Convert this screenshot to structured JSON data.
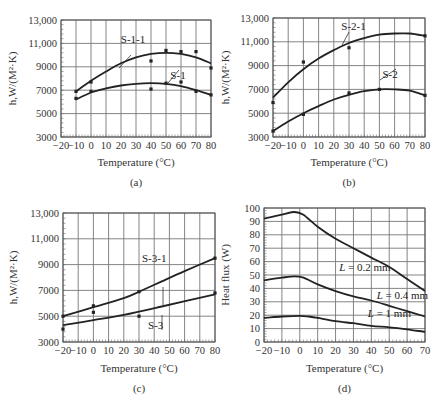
{
  "chart_data": [
    {
      "id": "a",
      "type": "line",
      "caption": "(a)",
      "xlabel": "Temperature (°C)",
      "ylabel": "h,W/(M²·K)",
      "xlim": [
        -20,
        80
      ],
      "ylim": [
        3000,
        13000
      ],
      "xticks": [
        -20,
        -10,
        0,
        10,
        20,
        30,
        40,
        50,
        60,
        70,
        80
      ],
      "yticks": [
        3000,
        5000,
        7000,
        9000,
        11000,
        13000
      ],
      "ytick_labels": [
        "3000",
        "5000",
        "7000",
        "9000",
        "11,000",
        "13,000"
      ],
      "grid": true,
      "series": [
        {
          "name": "S-1-1",
          "curve": {
            "x": [
              -10,
              0,
              10,
              20,
              30,
              40,
              50,
              60,
              70,
              80
            ],
            "y": [
              6900,
              7800,
              8600,
              9300,
              9800,
              10100,
              10200,
              10100,
              9800,
              9300
            ]
          },
          "points": {
            "x": [
              -10,
              0,
              40,
              50,
              60,
              70,
              80
            ],
            "y": [
              6900,
              7700,
              9500,
              10400,
              10300,
              10300,
              8900
            ]
          }
        },
        {
          "name": "S-1",
          "curve": {
            "x": [
              -10,
              0,
              10,
              20,
              30,
              40,
              50,
              60,
              70,
              80
            ],
            "y": [
              6200,
              6800,
              7150,
              7400,
              7550,
              7600,
              7550,
              7350,
              7000,
              6600
            ]
          },
          "points": {
            "x": [
              -10,
              0,
              40,
              50,
              60,
              70,
              80
            ],
            "y": [
              6300,
              6900,
              7100,
              7600,
              7700,
              6900,
              6600
            ]
          }
        }
      ],
      "annotations": [
        {
          "text": "S-1-1",
          "x": 28,
          "y": 11000
        },
        {
          "text": "S-1",
          "x": 58,
          "y": 8000
        }
      ]
    },
    {
      "id": "b",
      "type": "line",
      "caption": "(b)",
      "xlabel": "Temperature (°C)",
      "ylabel": "h,W/(M²·K)",
      "xlim": [
        -20,
        80
      ],
      "ylim": [
        3000,
        13000
      ],
      "xticks": [
        -20,
        -10,
        0,
        10,
        20,
        30,
        40,
        50,
        60,
        70,
        80
      ],
      "yticks": [
        3000,
        5000,
        7000,
        9000,
        11000,
        13000
      ],
      "ytick_labels": [
        "3000",
        "5000",
        "7000",
        "9000",
        "11,000",
        "13,000"
      ],
      "grid": true,
      "series": [
        {
          "name": "S-2-1",
          "curve": {
            "x": [
              -20,
              -10,
              0,
              10,
              20,
              30,
              40,
              50,
              60,
              70,
              80
            ],
            "y": [
              6300,
              7600,
              8700,
              9600,
              10300,
              10900,
              11300,
              11600,
              11700,
              11700,
              11500
            ]
          },
          "points": {
            "x": [
              -20,
              0,
              30,
              80
            ],
            "y": [
              5900,
              9300,
              10500,
              11500
            ]
          }
        },
        {
          "name": "S-2",
          "curve": {
            "x": [
              -20,
              -10,
              0,
              10,
              20,
              30,
              40,
              50,
              60,
              70,
              80
            ],
            "y": [
              3500,
              4300,
              5000,
              5600,
              6150,
              6550,
              6850,
              7000,
              7000,
              6900,
              6500
            ]
          },
          "points": {
            "x": [
              -20,
              0,
              30,
              50,
              80
            ],
            "y": [
              3500,
              4900,
              6700,
              7000,
              6500
            ]
          }
        }
      ],
      "annotations": [
        {
          "text": "S-2-1",
          "x": 33,
          "y": 12000
        },
        {
          "text": "S-2",
          "x": 57,
          "y": 8000
        }
      ]
    },
    {
      "id": "c",
      "type": "line",
      "caption": "(c)",
      "xlabel": "Temperature (°C)",
      "ylabel": "h,W/(M²·K)",
      "xlim": [
        -20,
        80
      ],
      "ylim": [
        3000,
        13000
      ],
      "xticks": [
        -20,
        -10,
        0,
        10,
        20,
        30,
        40,
        50,
        60,
        70,
        80
      ],
      "yticks": [
        3000,
        5000,
        7000,
        9000,
        11000,
        13000
      ],
      "ytick_labels": [
        "3000",
        "5000",
        "7000",
        "9000",
        "11,000",
        "13,000"
      ],
      "grid": true,
      "series": [
        {
          "name": "S-3-1",
          "curve": {
            "x": [
              -20,
              0,
              20,
              30,
              45,
              60,
              80
            ],
            "y": [
              5000,
              5700,
              6400,
              6900,
              7700,
              8500,
              9500
            ]
          },
          "points": {
            "x": [
              -20,
              0,
              30,
              80
            ],
            "y": [
              5000,
              5800,
              6900,
              9500
            ]
          }
        },
        {
          "name": "S-3",
          "curve": {
            "x": [
              -20,
              0,
              20,
              45,
              80
            ],
            "y": [
              4300,
              4700,
              5100,
              5750,
              6700
            ]
          },
          "points": {
            "x": [
              -20,
              0,
              30,
              80
            ],
            "y": [
              4000,
              5300,
              5000,
              6800
            ]
          }
        }
      ],
      "annotations": [
        {
          "text": "S-3-1",
          "x": 40,
          "y": 9200
        },
        {
          "text": "S-3",
          "x": 41,
          "y": 4000
        }
      ]
    },
    {
      "id": "d",
      "type": "line",
      "caption": "(d)",
      "xlabel": "Temperature (°C)",
      "ylabel": "Heat flux (W)",
      "xlim": [
        -20,
        70
      ],
      "ylim": [
        0,
        100
      ],
      "xticks": [
        -20,
        -10,
        0,
        10,
        20,
        30,
        40,
        50,
        60,
        70
      ],
      "yticks": [
        0,
        10,
        20,
        30,
        40,
        50,
        60,
        70,
        80,
        90,
        100
      ],
      "ytick_labels": [
        "0",
        "10",
        "20",
        "30",
        "40",
        "50",
        "60",
        "70",
        "80",
        "90",
        "100"
      ],
      "grid": true,
      "series": [
        {
          "name": "L = 0.2 mm",
          "x": [
            -20,
            -10,
            -3,
            2,
            10,
            20,
            30,
            40,
            50,
            60,
            70
          ],
          "y": [
            92,
            95,
            97,
            95,
            86,
            77,
            70,
            63,
            56,
            47,
            38
          ]
        },
        {
          "name": "L = 0.4 mm",
          "x": [
            -20,
            -10,
            -3,
            2,
            10,
            20,
            30,
            40,
            50,
            60,
            70
          ],
          "y": [
            46,
            48,
            49,
            48,
            43,
            38,
            34,
            31,
            27,
            23,
            19
          ]
        },
        {
          "name": "L = 1 mm",
          "x": [
            -20,
            -10,
            0,
            5,
            10,
            20,
            30,
            40,
            50,
            60,
            70
          ],
          "y": [
            18,
            19,
            19.5,
            19,
            18,
            15.5,
            14,
            12,
            11,
            9.5,
            7.5
          ]
        }
      ],
      "annotations": [
        {
          "text": "L = 0.2 mm",
          "x": 22,
          "y": 53
        },
        {
          "text": "L = 0.4 mm",
          "x": 43,
          "y": 32
        },
        {
          "text": "L = 1 mm",
          "x": 38,
          "y": 19
        }
      ]
    }
  ]
}
